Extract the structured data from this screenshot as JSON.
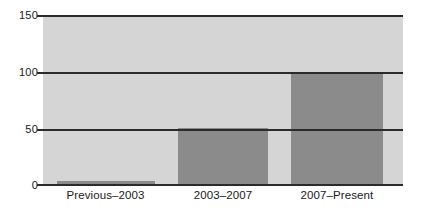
{
  "chart_data": {
    "type": "bar",
    "title": "",
    "subtitle": "",
    "xlabel": "",
    "ylabel": "",
    "categories": [
      "Previous–2003",
      "2003–2007",
      "2007–Present"
    ],
    "values": [
      3,
      50,
      100
    ],
    "ylim": [
      0,
      150
    ],
    "yticks": [
      "0",
      "50",
      "100",
      "150"
    ],
    "ytick_values": [
      0,
      50,
      100,
      150
    ],
    "grid": true,
    "legend": "none",
    "series": [
      {
        "name": "count",
        "values": [
          3,
          50,
          100
        ]
      }
    ],
    "colors": {
      "plot_background": "#d5d5d5",
      "bar_fill": "#8b8b8b",
      "gridline": "#2b2b2b",
      "page_background": "#ffffff",
      "text": "#1a1a1a"
    }
  },
  "axes": {
    "y": {
      "ticks": [
        {
          "label": "150",
          "value": 150
        },
        {
          "label": "100",
          "value": 100
        },
        {
          "label": "50",
          "value": 50
        },
        {
          "label": "0",
          "value": 0
        }
      ]
    },
    "x": {
      "ticks": [
        {
          "label": "Previous–2003"
        },
        {
          "label": "2003–2007"
        },
        {
          "label": "2007–Present"
        }
      ]
    }
  }
}
